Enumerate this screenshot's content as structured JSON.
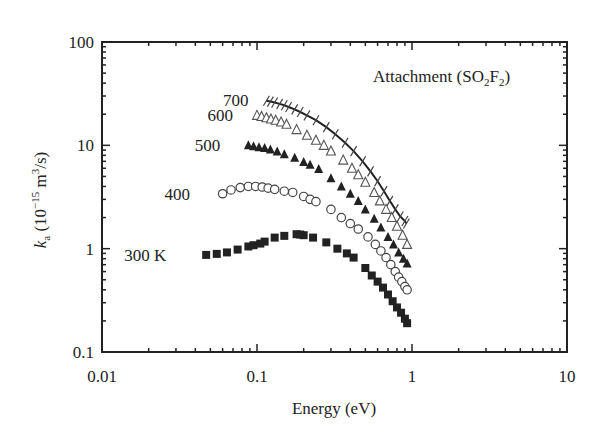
{
  "chart_data": {
    "type": "scatter",
    "title": "",
    "annotation": "Attachment (SO2F2)",
    "annotation_parts": {
      "main": "Attachment (SO",
      "sub1": "2",
      "mid": "F",
      "sub2": "2",
      "end": ")"
    },
    "xlabel": "Energy (eV)",
    "ylabel": "k_a (10^-15 m^3/s)",
    "ylabel_parts": {
      "k": "k",
      "sub": "a",
      "pre": " (10",
      "exp": "−15",
      "mid": " m",
      "exp2": "3",
      "end": "/s)"
    },
    "xscale": "log",
    "yscale": "log",
    "xlim": [
      0.01,
      10
    ],
    "ylim": [
      0.1,
      100
    ],
    "x_ticks": [
      "0.01",
      "0.1",
      "1",
      "10"
    ],
    "y_ticks": [
      "0.1",
      "1",
      "10",
      "100"
    ],
    "grid": false,
    "legend": "inline labels",
    "series": [
      {
        "name": "300 K",
        "label": "300 K",
        "marker": "filled-square",
        "x": [
          0.047,
          0.055,
          0.064,
          0.075,
          0.088,
          0.095,
          0.105,
          0.112,
          0.13,
          0.15,
          0.18,
          0.19,
          0.2,
          0.23,
          0.28,
          0.33,
          0.38,
          0.42,
          0.5,
          0.55,
          0.6,
          0.65,
          0.7,
          0.75,
          0.8,
          0.85,
          0.9,
          0.93
        ],
        "y": [
          0.87,
          0.89,
          0.92,
          0.98,
          1.05,
          1.08,
          1.12,
          1.17,
          1.28,
          1.33,
          1.38,
          1.37,
          1.35,
          1.28,
          1.15,
          1.0,
          0.9,
          0.82,
          0.65,
          0.55,
          0.48,
          0.42,
          0.36,
          0.31,
          0.27,
          0.24,
          0.21,
          0.19
        ]
      },
      {
        "name": "400",
        "label": "400",
        "marker": "open-circle",
        "x": [
          0.06,
          0.068,
          0.078,
          0.088,
          0.098,
          0.108,
          0.118,
          0.13,
          0.15,
          0.17,
          0.2,
          0.22,
          0.24,
          0.3,
          0.35,
          0.4,
          0.45,
          0.52,
          0.58,
          0.63,
          0.68,
          0.73,
          0.78,
          0.82,
          0.86,
          0.9,
          0.93
        ],
        "y": [
          3.4,
          3.7,
          3.9,
          4.0,
          4.0,
          3.95,
          3.85,
          3.75,
          3.6,
          3.5,
          3.2,
          3.0,
          2.85,
          2.4,
          2.0,
          1.75,
          1.55,
          1.3,
          1.1,
          0.95,
          0.82,
          0.7,
          0.6,
          0.53,
          0.48,
          0.43,
          0.4
        ]
      },
      {
        "name": "500",
        "label": "500",
        "marker": "filled-triangle",
        "x": [
          0.088,
          0.095,
          0.103,
          0.112,
          0.122,
          0.135,
          0.15,
          0.175,
          0.2,
          0.22,
          0.25,
          0.3,
          0.35,
          0.4,
          0.45,
          0.5,
          0.57,
          0.63,
          0.7,
          0.76,
          0.82,
          0.88,
          0.93
        ],
        "y": [
          10.0,
          9.8,
          9.6,
          9.4,
          9.1,
          8.7,
          8.2,
          7.6,
          6.9,
          6.5,
          5.9,
          4.8,
          4.0,
          3.4,
          2.9,
          2.4,
          1.95,
          1.6,
          1.3,
          1.1,
          0.92,
          0.8,
          0.72
        ]
      },
      {
        "name": "600",
        "label": "600",
        "marker": "open-triangle",
        "x": [
          0.1,
          0.107,
          0.115,
          0.123,
          0.132,
          0.143,
          0.155,
          0.18,
          0.21,
          0.24,
          0.27,
          0.3,
          0.36,
          0.41,
          0.45,
          0.5,
          0.57,
          0.62,
          0.68,
          0.74,
          0.8,
          0.87,
          0.93
        ],
        "y": [
          19.5,
          19.0,
          18.5,
          18.0,
          17.5,
          16.8,
          16.0,
          14.2,
          12.5,
          11.2,
          10.0,
          8.8,
          7.2,
          6.0,
          5.2,
          4.4,
          3.5,
          2.9,
          2.4,
          2.0,
          1.65,
          1.35,
          1.1
        ]
      },
      {
        "name": "700",
        "label": "700",
        "marker": "cross",
        "fit_line": true,
        "x": [
          0.115,
          0.122,
          0.13,
          0.14,
          0.15,
          0.16,
          0.175,
          0.19,
          0.21,
          0.24,
          0.28,
          0.32,
          0.37,
          0.42,
          0.48,
          0.54,
          0.6,
          0.66,
          0.72,
          0.78,
          0.84,
          0.9,
          0.92
        ],
        "y": [
          27.0,
          26.5,
          26.0,
          25.2,
          24.4,
          23.5,
          22.3,
          21.0,
          19.5,
          17.5,
          15.0,
          12.8,
          10.6,
          8.8,
          7.0,
          5.6,
          4.5,
          3.6,
          2.9,
          2.4,
          2.05,
          1.85,
          1.75
        ]
      }
    ],
    "series_labels": [
      {
        "text": "300 K",
        "x": 0.026,
        "y": 0.87
      },
      {
        "text": "400",
        "x": 0.037,
        "y": 3.4
      },
      {
        "text": "500",
        "x": 0.058,
        "y": 10.0
      },
      {
        "text": "600",
        "x": 0.07,
        "y": 19.5
      },
      {
        "text": "700",
        "x": 0.088,
        "y": 27.5
      }
    ]
  }
}
